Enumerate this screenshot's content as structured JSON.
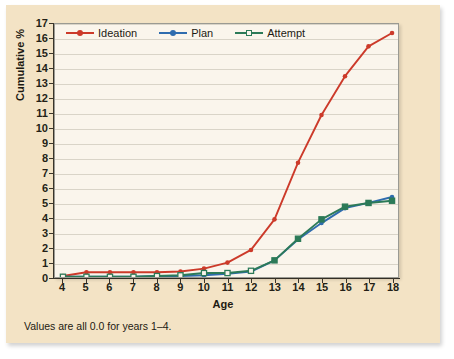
{
  "chart_data": {
    "type": "line",
    "title": "",
    "xlabel": "Age",
    "ylabel": "Cumulative %",
    "x": [
      4,
      5,
      6,
      7,
      8,
      9,
      10,
      11,
      12,
      13,
      14,
      15,
      16,
      17,
      18
    ],
    "xtick_labels": [
      "4",
      "5",
      "6",
      "7",
      "8",
      "9",
      "10",
      "11",
      "12",
      "13",
      "14",
      "15",
      "16",
      "17",
      "18"
    ],
    "ytick_labels": [
      "0",
      "1",
      "2",
      "3",
      "4",
      "5",
      "6",
      "7",
      "8",
      "9",
      "10",
      "11",
      "12",
      "13",
      "14",
      "15",
      "16",
      "17"
    ],
    "ylim": [
      0,
      17
    ],
    "xlim": [
      4,
      18
    ],
    "grid": true,
    "legend_position": "top-left-inside",
    "series": [
      {
        "name": "Ideation",
        "color": "#cc3a2a",
        "marker": "circle",
        "values": [
          0.1,
          0.35,
          0.35,
          0.35,
          0.35,
          0.4,
          0.6,
          1.0,
          1.85,
          3.9,
          7.7,
          10.9,
          13.5,
          15.5,
          16.4
        ]
      },
      {
        "name": "Plan",
        "color": "#2f6cae",
        "marker": "circle",
        "values": [
          0.05,
          0.05,
          0.05,
          0.05,
          0.1,
          0.1,
          0.15,
          0.25,
          0.4,
          1.15,
          2.55,
          3.65,
          4.65,
          5.0,
          5.4
        ]
      },
      {
        "name": "Attempt",
        "color": "#2c7a58",
        "marker": "open-square",
        "values": [
          0.05,
          0.05,
          0.05,
          0.05,
          0.1,
          0.15,
          0.3,
          0.3,
          0.45,
          1.15,
          2.6,
          3.9,
          4.75,
          5.0,
          5.15
        ]
      }
    ],
    "footnote": "Values are all 0.0 for years 1–4."
  },
  "colors": {
    "card_background": "#f3e3c5",
    "plot_background": "#faf5ec",
    "axis": "#3a352b",
    "gridline": "#d9d4c8",
    "text": "#1d1a12",
    "baseline_highlight": "#e8dc5a"
  }
}
